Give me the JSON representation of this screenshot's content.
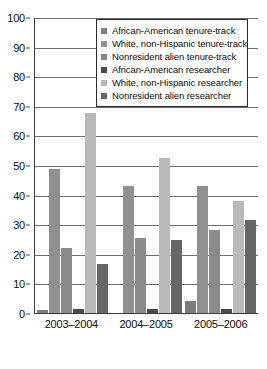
{
  "chart_data": {
    "type": "bar",
    "title": "",
    "xlabel": "",
    "ylabel": "",
    "ylim": [
      0,
      100
    ],
    "ytick_step": 10,
    "yticks": [
      100,
      90,
      80,
      70,
      60,
      50,
      40,
      30,
      20,
      10,
      0
    ],
    "grid": true,
    "legend_position": "top-right-inside",
    "categories": [
      "2003–2004",
      "2004–2005",
      "2005–2006"
    ],
    "series": [
      {
        "name": "African-American tenure-track",
        "color": "#7d7d7d",
        "values": [
          1,
          0,
          4
        ]
      },
      {
        "name": "White, non-Hispanic tenure-track",
        "color": "#909090",
        "values": [
          48.5,
          43,
          43
        ]
      },
      {
        "name": "Nonresident alien tenure-track",
        "color": "#8a8a8a",
        "values": [
          22,
          25.5,
          28
        ]
      },
      {
        "name": "African-American researcher",
        "color": "#4a4a4a",
        "values": [
          1.5,
          1.5,
          1.5
        ]
      },
      {
        "name": "White, non-Hispanic researcher",
        "color": "#b9b9b9",
        "values": [
          67.5,
          52.5,
          38
        ]
      },
      {
        "name": "Nonresident alien researcher",
        "color": "#666666",
        "values": [
          16.5,
          24.5,
          31.5
        ]
      }
    ]
  }
}
